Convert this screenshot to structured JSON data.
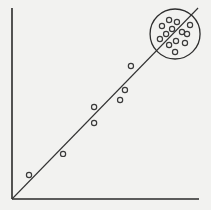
{
  "chart_data": {
    "type": "scatter",
    "title": "",
    "xlabel": "",
    "ylabel": "",
    "xlim": [
      0,
      100
    ],
    "ylim": [
      0,
      100
    ],
    "grid": false,
    "legend": null,
    "series": [
      {
        "name": "points",
        "marker": "open-circle",
        "x": [
          9.1,
          27.3,
          43.9,
          43.9,
          57.8,
          60.4,
          63.6,
          80.2,
          84.0,
          88.2,
          95.2,
          85.6,
          90.9,
          82.4,
          93.6,
          79.1,
          87.7,
          92.5,
          84.0,
          87.2
        ],
        "y": [
          12.6,
          23.6,
          39.8,
          48.2,
          51.8,
          57.1,
          69.6,
          90.6,
          93.7,
          92.7,
          91.1,
          89.0,
          87.4,
          86.4,
          86.4,
          83.8,
          82.7,
          81.7,
          80.6,
          77.0
        ]
      }
    ],
    "fit_line": {
      "x": [
        0,
        99.5
      ],
      "y": [
        0,
        100
      ]
    },
    "annotations": [
      {
        "type": "circle",
        "label": "cluster",
        "center": [
          87.2,
          86.4
        ],
        "point_count": 13
      }
    ]
  },
  "colors": {
    "background": "#f2f2f0",
    "ink": "#2e2e2e"
  }
}
